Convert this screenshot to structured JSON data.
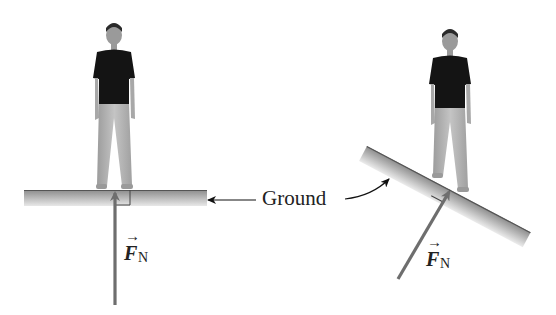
{
  "figure": {
    "ground_label": "Ground",
    "left_panel": {
      "force_symbol": "F",
      "force_subscript": "N",
      "arrow_over": "→",
      "description": "Person standing on level ground; normal force vertical"
    },
    "right_panel": {
      "force_symbol": "F",
      "force_subscript": "N",
      "arrow_over": "→",
      "description": "Person standing on inclined ground; normal force perpendicular to surface"
    },
    "colors": {
      "force_arrow": "#6e6e6e",
      "ground_dark": "#8a8a8a",
      "ground_light": "#e6e6e6",
      "shirt": "#141414",
      "pants": "#b4b4b4",
      "skin": "#a8a8a8",
      "text": "#222222"
    }
  }
}
